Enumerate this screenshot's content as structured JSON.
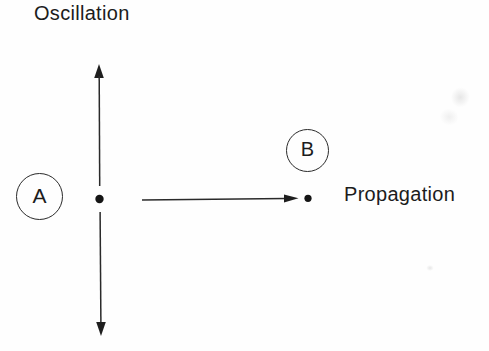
{
  "figure": {
    "labels": {
      "oscillation": "Oscillation",
      "propagation": "Propagation"
    },
    "nodes": {
      "a": "A",
      "b": "B"
    },
    "colors": {
      "ink": "#1c1c1c",
      "line": "#2a2a2a",
      "background": "#fefefe"
    }
  }
}
